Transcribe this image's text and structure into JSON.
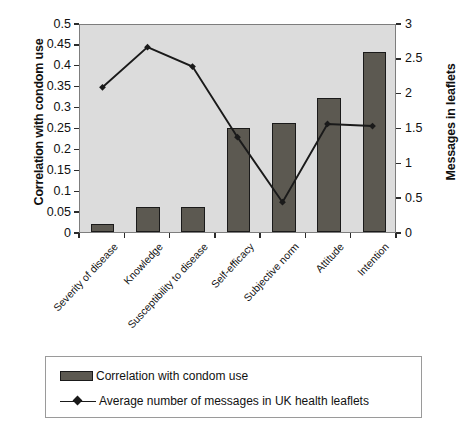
{
  "chart_data": {
    "type": "bar",
    "title": "",
    "subtitle": "",
    "categories": [
      "Severity of disease",
      "Knowledge",
      "Susceptibility to disease",
      "Self-efficacy",
      "Subjective norm",
      "Attitude",
      "Intention"
    ],
    "series": [
      {
        "name": "Correlation with condom use",
        "type": "bar",
        "axis": "left",
        "values": [
          0.02,
          0.06,
          0.06,
          0.25,
          0.26,
          0.32,
          0.43
        ],
        "color": "#5c5951"
      },
      {
        "name": "Average number of messages in UK health leaflets",
        "type": "line",
        "axis": "right",
        "values": [
          2.1,
          2.68,
          2.4,
          1.38,
          0.44,
          1.57,
          1.54
        ],
        "color": "#1a1a1a",
        "marker": "diamond"
      }
    ],
    "xlabel": "",
    "ylabel": "Correlation with condom use",
    "ylabel_secondary": "Messages in leaflets",
    "ylim": [
      0,
      0.5
    ],
    "ylim_secondary": [
      0,
      3
    ],
    "yticks": [
      "0",
      "0.05",
      "0.1",
      "0.15",
      "0.2",
      "0.25",
      "0.3",
      "0.35",
      "0.4",
      "0.45",
      "0.5"
    ],
    "yticks_secondary": [
      "0",
      "0.5",
      "1",
      "1.5",
      "2",
      "2.5",
      "3"
    ],
    "grid": false,
    "legend_position": "bottom",
    "plot_background": "#dcdcdc"
  },
  "axes": {
    "left_title": "Correlation with condom use",
    "right_title": "Messages in leaflets"
  },
  "legend": {
    "entries": [
      {
        "label": "Correlation with condom use",
        "marker": "bar-swatch"
      },
      {
        "label": "Average number of messages in UK health leaflets",
        "marker": "line-diamond"
      }
    ]
  }
}
